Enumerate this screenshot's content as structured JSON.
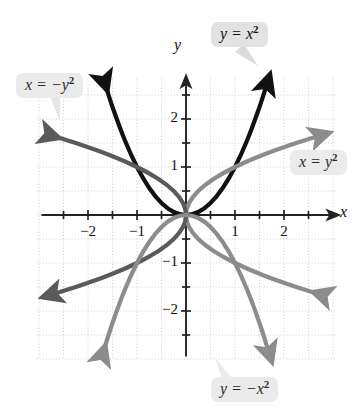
{
  "figure": {
    "background_color": "#ffffff",
    "grid_color": "#cccccc",
    "axis_color": "#222222"
  },
  "axes": {
    "x_name": "x",
    "y_name": "y",
    "x_tick_labels": [
      "-2",
      "-1",
      "1",
      "2"
    ],
    "x_tick_values": [
      -2,
      -1,
      1,
      2
    ],
    "y_tick_labels": [
      "2",
      "1",
      "-1",
      "-2"
    ],
    "y_tick_values": [
      2,
      1,
      -1,
      -2
    ],
    "minor_tick_step": 0.5
  },
  "labels": {
    "y_eq_x2": {
      "lhs": "y",
      "op": "=",
      "rhs": "x",
      "exp": "2",
      "text": "y = x²"
    },
    "x_eq_neg_y2": {
      "lhs": "x",
      "op": "=",
      "rhs": "−y",
      "exp": "2",
      "text": "x = −y²"
    },
    "x_eq_y2": {
      "lhs": "x",
      "op": "=",
      "rhs": "y",
      "exp": "2",
      "text": "x = y²"
    },
    "y_eq_neg_x2": {
      "lhs": "y",
      "op": "=",
      "rhs": "−x",
      "exp": "2",
      "text": "y = −x²"
    }
  },
  "chart_data": {
    "type": "line",
    "title": "",
    "xlabel": "x",
    "ylabel": "y",
    "xlim": [
      -3.05,
      3.05
    ],
    "ylim": [
      -3.0,
      2.85
    ],
    "grid": true,
    "grid_step": 0.5,
    "legend_position": "callouts",
    "series": [
      {
        "name": "y = x²",
        "equation": "y = x^2",
        "color": "#111111",
        "width": 4.2,
        "arrows": [
          "start",
          "end"
        ],
        "points": [
          [
            -1.66,
            2.76
          ],
          [
            -1.5,
            2.25
          ],
          [
            -1.25,
            1.5625
          ],
          [
            -1.0,
            1.0
          ],
          [
            -0.75,
            0.5625
          ],
          [
            -0.5,
            0.25
          ],
          [
            -0.25,
            0.0625
          ],
          [
            0,
            0
          ],
          [
            0.25,
            0.0625
          ],
          [
            0.5,
            0.25
          ],
          [
            0.75,
            0.5625
          ],
          [
            1.0,
            1.0
          ],
          [
            1.25,
            1.5625
          ],
          [
            1.5,
            2.25
          ],
          [
            1.66,
            2.76
          ]
        ]
      },
      {
        "name": "x = y²",
        "equation": "x = y^2",
        "color": "#8c8c8c",
        "width": 4.2,
        "arrows": [
          "start",
          "end"
        ],
        "points": [
          [
            2.76,
            -1.66
          ],
          [
            2.25,
            -1.5
          ],
          [
            1.5625,
            -1.25
          ],
          [
            1.0,
            -1.0
          ],
          [
            0.5625,
            -0.75
          ],
          [
            0.25,
            -0.5
          ],
          [
            0.0625,
            -0.25
          ],
          [
            0,
            0
          ],
          [
            0.0625,
            0.25
          ],
          [
            0.25,
            0.5
          ],
          [
            0.5625,
            0.75
          ],
          [
            1.0,
            1.0
          ],
          [
            1.5625,
            1.25
          ],
          [
            2.25,
            1.5
          ],
          [
            2.76,
            1.66
          ]
        ]
      },
      {
        "name": "x = −y²",
        "equation": "x = -y^2",
        "color": "#5a5a5a",
        "width": 4.2,
        "arrows": [
          "start",
          "end"
        ],
        "points": [
          [
            -2.76,
            1.66
          ],
          [
            -2.25,
            1.5
          ],
          [
            -1.5625,
            1.25
          ],
          [
            -1.0,
            1.0
          ],
          [
            -0.5625,
            0.75
          ],
          [
            -0.25,
            0.5
          ],
          [
            -0.0625,
            0.25
          ],
          [
            0,
            0
          ],
          [
            -0.0625,
            -0.25
          ],
          [
            -0.25,
            -0.5
          ],
          [
            -0.5625,
            -0.75
          ],
          [
            -1.0,
            -1.0
          ],
          [
            -1.5625,
            -1.25
          ],
          [
            -2.25,
            -1.5
          ],
          [
            -2.76,
            -1.66
          ]
        ]
      },
      {
        "name": "y = −x²",
        "equation": "y = -x^2",
        "color": "#8c8c8c",
        "width": 4.2,
        "arrows": [
          "start",
          "end"
        ],
        "points": [
          [
            -1.7,
            -2.89
          ],
          [
            -1.5,
            -2.25
          ],
          [
            -1.25,
            -1.5625
          ],
          [
            -1.0,
            -1.0
          ],
          [
            -0.75,
            -0.5625
          ],
          [
            -0.5,
            -0.25
          ],
          [
            -0.25,
            -0.0625
          ],
          [
            0,
            0
          ],
          [
            0.25,
            -0.0625
          ],
          [
            0.5,
            -0.25
          ],
          [
            0.75,
            -0.5625
          ],
          [
            1.0,
            -1.0
          ],
          [
            1.25,
            -1.5625
          ],
          [
            1.5,
            -2.25
          ],
          [
            1.7,
            -2.89
          ]
        ]
      }
    ],
    "annotations": [
      {
        "text": "y = x²",
        "anchor": [
          1.55,
          2.55
        ],
        "box": true
      },
      {
        "text": "x = −y²",
        "anchor": [
          -2.6,
          1.95
        ],
        "box": true
      },
      {
        "text": "x = y²",
        "anchor": [
          2.55,
          0.75
        ],
        "box": true
      },
      {
        "text": "y = −x²",
        "anchor": [
          1.0,
          -2.95
        ],
        "box": true
      }
    ]
  }
}
